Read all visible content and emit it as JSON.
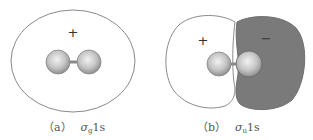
{
  "panels": [
    {
      "id": "a",
      "label": "（a）",
      "orbital_symbol": "σ",
      "orbital_subscript": "g",
      "orbital_suffix": "1s",
      "phase_signs": [
        "+"
      ],
      "description": "bonding sigma_g 1s orbital envelope enclosing both nuclei"
    },
    {
      "id": "b",
      "label": "（b）",
      "orbital_symbol": "σ",
      "orbital_subscript": "u",
      "orbital_suffix": "1s",
      "phase_signs": [
        "+",
        "−"
      ],
      "description": "antibonding sigma_u 1s orbital with two lobes of opposite phase"
    }
  ],
  "colors": {
    "outline": "#8a8a8a",
    "negative_lobe": "#7a7a7a",
    "atom_light": "#e6e6e6",
    "atom_dark": "#9a9a9a"
  }
}
